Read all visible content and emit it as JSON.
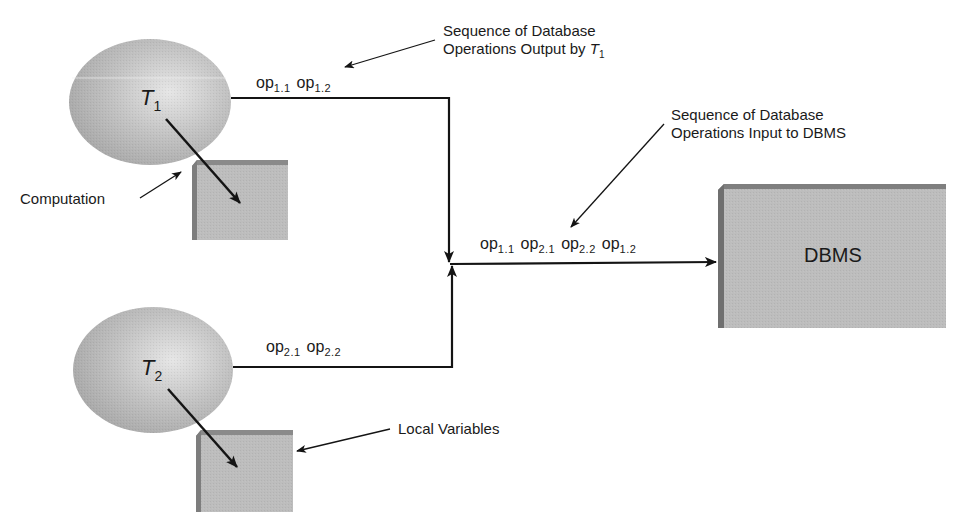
{
  "diagram": {
    "transactions": [
      {
        "id": "T1",
        "name": "T",
        "subscript": "1",
        "output_ops": [
          {
            "base": "op",
            "sub": "1.1"
          },
          {
            "base": "op",
            "sub": "1.2"
          }
        ]
      },
      {
        "id": "T2",
        "name": "T",
        "subscript": "2",
        "output_ops": [
          {
            "base": "op",
            "sub": "2.1"
          },
          {
            "base": "op",
            "sub": "2.2"
          }
        ]
      }
    ],
    "merged_ops": [
      {
        "base": "op",
        "sub": "1.1"
      },
      {
        "base": "op",
        "sub": "2.1"
      },
      {
        "base": "op",
        "sub": "2.2"
      },
      {
        "base": "op",
        "sub": "1.2"
      }
    ],
    "dbms": {
      "label": "DBMS"
    },
    "callouts": {
      "output_by_t1": {
        "line1": "Sequence of Database",
        "line2_prefix": "Operations Output by ",
        "line2_var": "T",
        "line2_sub": "1"
      },
      "input_to_dbms": {
        "line1": "Sequence of Database",
        "line2": "Operations Input to DBMS"
      },
      "computation": "Computation",
      "local_variables": "Local Variables"
    },
    "colors": {
      "shape_fill": "#b9b9b9",
      "shape_highlight": "#e4e4e4",
      "box_side": "#7d7d7d",
      "line": "#141414"
    }
  }
}
